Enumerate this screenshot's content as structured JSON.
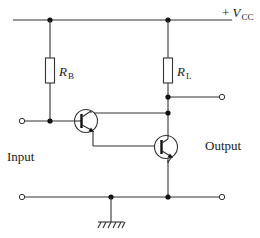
{
  "diagram": {
    "type": "circuit-schematic",
    "labels": {
      "supply": {
        "prefix": "+ ",
        "symbol": "V",
        "subscript": "CC"
      },
      "base_resistor": {
        "symbol": "R",
        "subscript": "B"
      },
      "load_resistor": {
        "symbol": "R",
        "subscript": "L"
      },
      "input": "Input",
      "output": "Output"
    },
    "components": [
      {
        "id": "RB",
        "kind": "resistor",
        "label": "R_B"
      },
      {
        "id": "RL",
        "kind": "resistor",
        "label": "R_L"
      },
      {
        "id": "Q1",
        "kind": "npn-transistor"
      },
      {
        "id": "Q2",
        "kind": "npn-transistor"
      },
      {
        "id": "GND",
        "kind": "ground"
      }
    ],
    "colors": {
      "wire": "#333333",
      "junction": "#111111",
      "background": "#ffffff"
    }
  }
}
